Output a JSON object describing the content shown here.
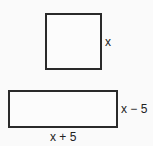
{
  "figure": {
    "square": {
      "side_label": "x"
    },
    "rectangle": {
      "height_label": "x − 5",
      "width_label": "x + 5"
    }
  },
  "colors": {
    "stroke": "#2a2a2a",
    "text": "#222222",
    "background": "#fafafa"
  }
}
